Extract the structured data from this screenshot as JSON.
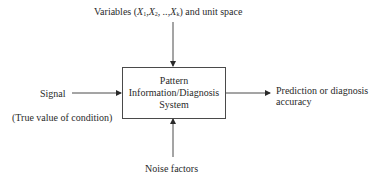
{
  "diagram": {
    "top_input": {
      "prefix": "Variables (",
      "vars": [
        "X",
        "1",
        ",X",
        "2",
        ", ..,X",
        "k"
      ],
      "suffix": ") and unit space"
    },
    "left_input": {
      "label": "Signal",
      "note": "(True value of condition)"
    },
    "system_box": {
      "lines": [
        "Pattern",
        "Information/Diagnosis",
        "System"
      ]
    },
    "output": {
      "lines": [
        "Prediction or diagnosis",
        "accuracy"
      ]
    },
    "bottom_input": {
      "label": "Noise factors"
    },
    "colors": {
      "line": "#4a4a4a",
      "text": "#2a2a2a",
      "background": "#ffffff"
    }
  }
}
